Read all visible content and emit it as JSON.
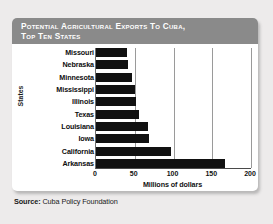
{
  "card": {
    "title": "Potential Agricultural Exports to Cuba,\nTop Ten States"
  },
  "source": {
    "label": "Source:",
    "text": "Cuba Policy Foundation"
  },
  "colors": {
    "header_bg": "#8a8a8a",
    "bar": "#111111",
    "card_bg": "#ffffff",
    "page_bg": "#edebeb",
    "gridline": "#9a9a9a"
  },
  "chart_data": {
    "type": "bar",
    "orientation": "horizontal",
    "title": "Potential Agricultural Exports to Cuba, Top Ten States",
    "xlabel": "Millions of dollars",
    "ylabel": "States",
    "categories": [
      "Missouri",
      "Nebraska",
      "Minnesota",
      "Mississippi",
      "Illinois",
      "Texas",
      "Louisiana",
      "Iowa",
      "California",
      "Arkansas"
    ],
    "values": [
      40,
      41,
      46,
      50,
      51,
      55,
      67,
      69,
      97,
      166
    ],
    "xlim": [
      0,
      200
    ],
    "xticks": [
      0,
      50,
      100,
      150,
      200
    ],
    "xtick_labels": [
      "0",
      "50",
      "100",
      "150",
      "200"
    ],
    "grid": "vertical",
    "legend": "none",
    "series": [
      {
        "name": "Potential agricultural exports",
        "values": [
          40,
          41,
          46,
          50,
          51,
          55,
          67,
          69,
          97,
          166
        ]
      }
    ]
  }
}
